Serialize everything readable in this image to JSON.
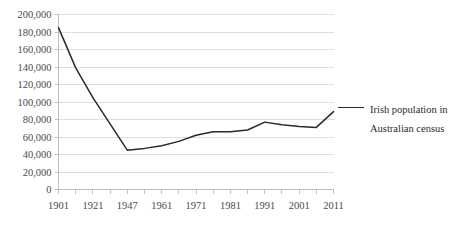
{
  "chart_data": {
    "type": "line",
    "title": "",
    "xlabel": "",
    "ylabel": "",
    "x": [
      1901,
      1911,
      1921,
      1933,
      1947,
      1954,
      1961,
      1966,
      1971,
      1976,
      1981,
      1986,
      1991,
      1996,
      2001,
      2006,
      2011
    ],
    "x_tick_labels": [
      "1901",
      "",
      "1921",
      "",
      "1947",
      "",
      "1961",
      "",
      "1971",
      "",
      "1981",
      "",
      "1991",
      "",
      "2001",
      "",
      "2011"
    ],
    "x_tick_labels_visible": [
      "1901",
      "1921",
      "1947",
      "1961",
      "1971",
      "1981",
      "1991",
      "2001",
      "2011"
    ],
    "series": [
      {
        "name": "Irish population in Australian census",
        "values": [
          185000,
          139000,
          105000,
          75000,
          45000,
          47000,
          50000,
          55000,
          62000,
          66000,
          66000,
          68000,
          77000,
          74000,
          72000,
          71000,
          89000
        ],
        "color": "#2a2a2a"
      }
    ],
    "ylim": [
      0,
      200000
    ],
    "y_ticks": [
      0,
      20000,
      40000,
      60000,
      80000,
      100000,
      120000,
      140000,
      160000,
      180000,
      200000
    ],
    "y_tick_labels": [
      "0",
      "20,000",
      "40,000",
      "60,000",
      "80,000",
      "100,000",
      "120,000",
      "140,000",
      "160,000",
      "180,000",
      "200,000"
    ],
    "grid": true,
    "grid_axis": "y",
    "legend_position": "right",
    "legend_entries": [
      {
        "label_line_1": "Irish population in",
        "label_line_2": "Australian census"
      }
    ],
    "colors": {
      "line": "#2a2a2a",
      "gridline": "#d6d6d6",
      "axis": "#b8b8b8",
      "text": "#4a4a4a",
      "background": "#ffffff"
    }
  }
}
